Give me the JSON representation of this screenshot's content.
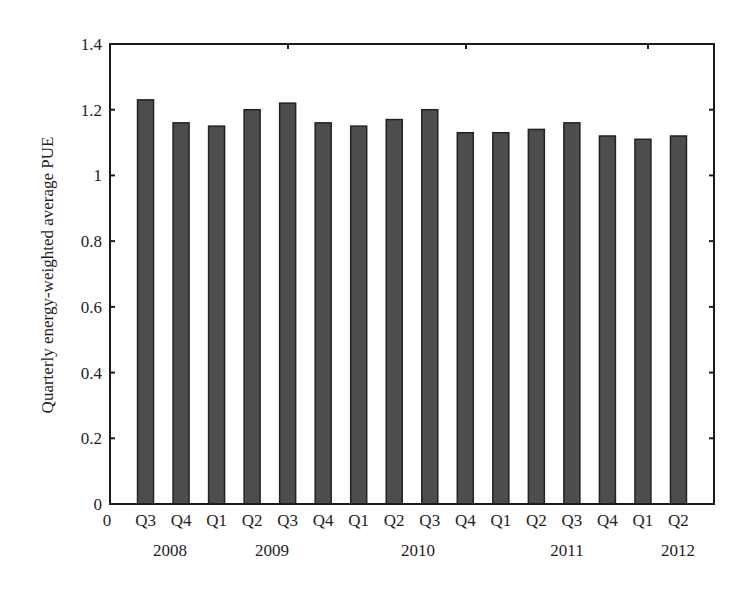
{
  "chart_data": {
    "type": "bar",
    "title": "",
    "xlabel": "",
    "ylabel": "Quarterly energy-weighted average PUE",
    "ylim": [
      0,
      1.4
    ],
    "yticks": [
      0,
      0.2,
      0.4,
      0.6,
      0.8,
      1,
      1.2,
      1.4
    ],
    "ytick_labels": [
      "0",
      "0.2",
      "0.4",
      "0.6",
      "0.8",
      "1",
      "1.2",
      "1.4"
    ],
    "x_origin_label": "0",
    "categories": [
      "Q3 2008",
      "Q4 2008",
      "Q1 2009",
      "Q2 2009",
      "Q3 2009",
      "Q4 2009",
      "Q1 2010",
      "Q2 2010",
      "Q3 2010",
      "Q4 2010",
      "Q1 2011",
      "Q2 2011",
      "Q3 2011",
      "Q4 2011",
      "Q1 2012",
      "Q2 2012"
    ],
    "quarter_labels": [
      "Q3",
      "Q4",
      "Q1",
      "Q2",
      "Q3",
      "Q4",
      "Q1",
      "Q2",
      "Q3",
      "Q4",
      "Q1",
      "Q2",
      "Q3",
      "Q4",
      "Q1",
      "Q2"
    ],
    "year_labels": [
      {
        "label": "2008",
        "x": 170
      },
      {
        "label": "2009",
        "x": 272
      },
      {
        "label": "2010",
        "x": 418
      },
      {
        "label": "2011",
        "x": 567
      },
      {
        "label": "2012",
        "x": 678
      }
    ],
    "values": [
      1.23,
      1.16,
      1.15,
      1.2,
      1.22,
      1.16,
      1.15,
      1.17,
      1.2,
      1.13,
      1.13,
      1.14,
      1.16,
      1.12,
      1.11,
      1.12
    ],
    "grid": false,
    "legend": null,
    "colors": {
      "bar_fill": "#4d4d4d",
      "bar_edge": "#222222",
      "axis": "#1a1a1a"
    }
  }
}
